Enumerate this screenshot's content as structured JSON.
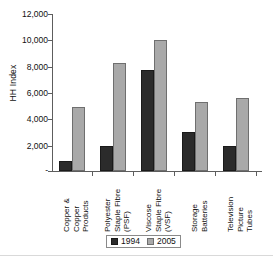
{
  "chart_data": {
    "type": "bar",
    "title": "",
    "xlabel": "",
    "ylabel": "HH Index",
    "ylim": [
      0,
      12000
    ],
    "grid": false,
    "legend_position": "bottom-center",
    "categories": [
      "Copper & Copper Products",
      "Polyester Staple Fibre (PSF)",
      "Viscose Staple Fibre (VSF)",
      "Storage Batteries",
      "Television Picture Tubes"
    ],
    "category_lines": [
      [
        "Copper &",
        "Copper",
        "Products"
      ],
      [
        "Polyester",
        "Staple Fibre",
        "(PSF)"
      ],
      [
        "Viscose",
        "Staple Fibre",
        "(VSF)"
      ],
      [
        "Storage",
        "Batteries"
      ],
      [
        "Television",
        "Picture",
        "Tubes"
      ]
    ],
    "series": [
      {
        "name": "1994",
        "color": "#2b2b2b",
        "values": [
          760,
          1900,
          7670,
          2960,
          1900
        ]
      },
      {
        "name": "2005",
        "color": "#a9a9a9",
        "values": [
          4860,
          8200,
          9980,
          5240,
          5540
        ]
      }
    ],
    "y_ticks": [
      {
        "value": 12000,
        "label": "12,000"
      },
      {
        "value": 10000,
        "label": "10,000"
      },
      {
        "value": 8000,
        "label": "8,000"
      },
      {
        "value": 6000,
        "label": "6,000"
      },
      {
        "value": 4000,
        "label": "4,000"
      },
      {
        "value": 2000,
        "label": "2,000"
      },
      {
        "value": 0,
        "label": "-"
      }
    ]
  },
  "legend": {
    "items": [
      {
        "label": "1994"
      },
      {
        "label": "2005"
      }
    ]
  }
}
